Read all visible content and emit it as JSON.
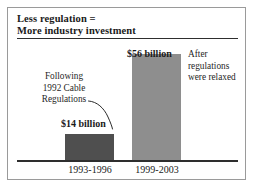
{
  "figure": {
    "title_lines": [
      "Less regulation =",
      "More industry investment"
    ]
  },
  "annotations": {
    "left": {
      "lines": [
        "Following",
        "1992 Cable",
        "Regulations"
      ],
      "leader": "curved-leader-line"
    },
    "right": {
      "lines": [
        "After",
        "regulations",
        "were relaxed"
      ]
    }
  },
  "colors": {
    "bar_before": "#4f4f4f",
    "bar_after": "#8e8e8e",
    "axis": "#2e2e2e",
    "frame": "#9a9a9a",
    "text": "#1a1a1a",
    "background": "#ffffff"
  },
  "chart_data": {
    "type": "bar",
    "title": "Less regulation = More industry investment",
    "subtitle": "",
    "categories": [
      "1993-1996",
      "1999-2003"
    ],
    "values": [
      14,
      56
    ],
    "value_labels": [
      "$14 billion",
      "$56 billion"
    ],
    "unit": "billion USD",
    "xlabel": "",
    "ylabel": "",
    "ylim": [
      0,
      60
    ],
    "grid": false,
    "legend": false,
    "bar_colors": [
      "#4f4f4f",
      "#8e8e8e"
    ],
    "annotations": [
      {
        "text": "Following 1992 Cable Regulations",
        "target_category": "1993-1996",
        "position": "left"
      },
      {
        "text": "After regulations were relaxed",
        "target_category": "1999-2003",
        "position": "right"
      }
    ]
  }
}
